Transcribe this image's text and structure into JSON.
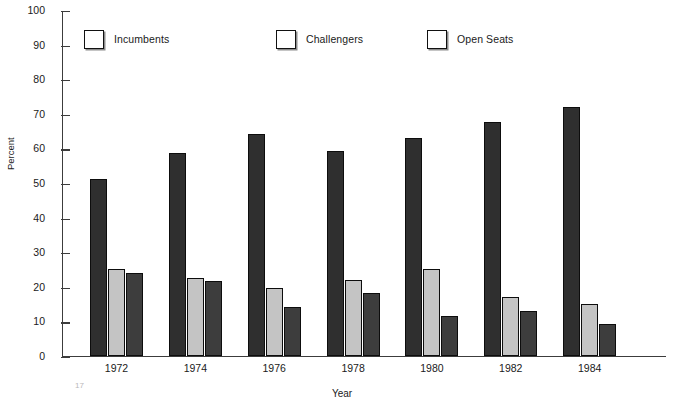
{
  "chart_data": {
    "type": "bar",
    "title": "",
    "xlabel": "Year",
    "ylabel": "Percent",
    "ylim": [
      0,
      100
    ],
    "ytick_step": 10,
    "yticks": [
      100,
      90,
      80,
      70,
      60,
      50,
      40,
      30,
      20,
      10,
      0
    ],
    "grid": false,
    "legend_position": "top",
    "categories": [
      "1972",
      "1974",
      "1976",
      "1978",
      "1980",
      "1982",
      "1984"
    ],
    "series": [
      {
        "name": "Incumbents",
        "color": "#2f2f2f",
        "values": [
          51,
          58.5,
          64,
          59,
          63,
          67.5,
          72
        ]
      },
      {
        "name": "Challengers",
        "color": "#c4c4c4",
        "values": [
          25,
          22.5,
          19.5,
          22,
          25,
          17,
          15
        ]
      },
      {
        "name": "Open Seats",
        "color": "#3d3d3d",
        "values": [
          24,
          21.5,
          14,
          18,
          11.5,
          13,
          9
        ]
      }
    ]
  },
  "axes": {
    "y_label": "Percent",
    "x_label": "Year",
    "y_tick_labels": [
      "100",
      "90",
      "80",
      "70",
      "60",
      "50",
      "40",
      "30",
      "20",
      "10",
      "0"
    ],
    "x_tick_labels": [
      "1972",
      "1974",
      "1976",
      "1978",
      "1980",
      "1982",
      "1984"
    ]
  },
  "legend": {
    "items": [
      {
        "label": "Incumbents",
        "color": "#2f2f2f"
      },
      {
        "label": "Challengers",
        "color": "#c4c4c4"
      },
      {
        "label": "Open Seats",
        "color": "#3d3d3d"
      }
    ]
  },
  "artifact": {
    "mark": "17"
  }
}
